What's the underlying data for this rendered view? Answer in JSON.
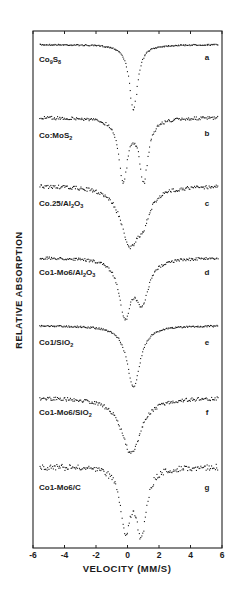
{
  "chart_data": {
    "type": "scatter",
    "title": "",
    "xlabel": "VELOCITY (MM/S)",
    "ylabel": "RELATIVE ABSORPTION",
    "xlim": [
      -6,
      6
    ],
    "xticks": [
      -6,
      -4,
      -2,
      0,
      2,
      4,
      6
    ],
    "xtick_labels": [
      "-6",
      "-4",
      "-2",
      "0",
      "2",
      "4",
      "6"
    ],
    "grid": false,
    "legend": "none",
    "series": [
      {
        "name": "Co9S8",
        "label_main": "Co",
        "sub1": "9",
        "mid": "S",
        "sub2": "8",
        "tag": "a",
        "baseline_px": 44,
        "noise": 0.6,
        "peaks": [
          {
            "center": 0.35,
            "width": 0.32,
            "depth": 66
          }
        ]
      },
      {
        "name": "Co:MoS2",
        "label_main": "Co:MoS",
        "sub1": "2",
        "mid": "",
        "sub2": "",
        "tag": "b",
        "baseline_px": 117,
        "noise": 1.6,
        "peaks": [
          {
            "center": -0.3,
            "width": 0.33,
            "depth": 62
          },
          {
            "center": 1.0,
            "width": 0.33,
            "depth": 62
          }
        ]
      },
      {
        "name": "Co.25/Al2O3",
        "label_main": "Co.25/Al",
        "sub1": "2",
        "mid": "O",
        "sub2": "3",
        "tag": "c",
        "baseline_px": 185,
        "noise": 1.8,
        "peaks": [
          {
            "center": 0.1,
            "width": 0.7,
            "depth": 55
          },
          {
            "center": 0.95,
            "width": 0.5,
            "depth": 25
          }
        ]
      },
      {
        "name": "Co1-Mo6/Al2O3",
        "label_main": "Co1-Mo6/Al",
        "sub1": "2",
        "mid": "O",
        "sub2": "3",
        "tag": "d",
        "baseline_px": 257,
        "noise": 1.3,
        "peaks": [
          {
            "center": -0.2,
            "width": 0.45,
            "depth": 55
          },
          {
            "center": 0.9,
            "width": 0.5,
            "depth": 42
          }
        ]
      },
      {
        "name": "Co1/SiO2",
        "label_main": "Co1/SiO",
        "sub1": "2",
        "mid": "",
        "sub2": "",
        "tag": "e",
        "baseline_px": 325,
        "noise": 0.8,
        "peaks": [
          {
            "center": 0.35,
            "width": 0.5,
            "depth": 62
          }
        ]
      },
      {
        "name": "Co1-Mo6/SiO2",
        "label_main": "Co1-Mo6/SiO",
        "sub1": "2",
        "mid": "",
        "sub2": "",
        "tag": "f",
        "baseline_px": 397,
        "noise": 1.8,
        "peaks": [
          {
            "center": 0.2,
            "width": 0.75,
            "depth": 56
          }
        ]
      },
      {
        "name": "Co1-Mo6/C",
        "label_main": "Co1-Mo6/C",
        "sub1": "",
        "mid": "",
        "sub2": "",
        "tag": "g",
        "baseline_px": 466,
        "noise": 3.0,
        "peaks": [
          {
            "center": -0.15,
            "width": 0.38,
            "depth": 60
          },
          {
            "center": 0.85,
            "width": 0.38,
            "depth": 64
          }
        ]
      }
    ]
  },
  "layout": {
    "frame": {
      "left": 33,
      "right": 222,
      "top": 31,
      "bottom": 548
    },
    "label_offsets_px": [
      18,
      21,
      21,
      18,
      20,
      18,
      24
    ],
    "tag_offsets_px": [
      16,
      19,
      21,
      18,
      20,
      18,
      24
    ]
  }
}
